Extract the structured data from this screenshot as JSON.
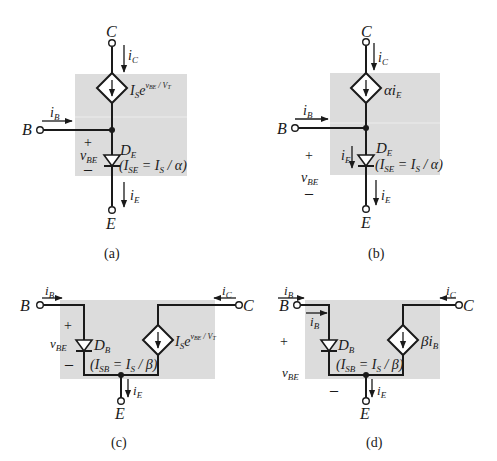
{
  "figure": {
    "panels": [
      {
        "id": "a",
        "caption": "(a)",
        "terminals": {
          "collector": "C",
          "base": "B",
          "emitter": "E"
        },
        "currents": {
          "ic": "i",
          "ic_sub": "C",
          "ib": "i",
          "ib_sub": "B",
          "ie": "i",
          "ie_sub": "E"
        },
        "source_label": {
          "main": "I",
          "sub": "S",
          "e": "e",
          "exp": "v",
          "exp_sub": "BE",
          "exp_tail": " / V",
          "exp_tail_sub": "T"
        },
        "diode": {
          "name": "D",
          "sub": "E",
          "param": "(I",
          "param_sub": "SE",
          "param_rest": " = I",
          "param_rest_sub": "S",
          "param_end": " / α)"
        },
        "vbe": {
          "plus": "+",
          "v": "v",
          "v_sub": "BE",
          "minus": "–"
        }
      },
      {
        "id": "b",
        "caption": "(b)",
        "terminals": {
          "collector": "C",
          "base": "B",
          "emitter": "E"
        },
        "currents": {
          "ic": "i",
          "ic_sub": "C",
          "ib": "i",
          "ib_sub": "B",
          "ie": "i",
          "ie_sub": "E"
        },
        "source_label": {
          "main": "αi",
          "sub": "E"
        },
        "diode": {
          "name": "D",
          "sub": "E",
          "param": "(I",
          "param_sub": "SE",
          "param_rest": " = I",
          "param_rest_sub": "S",
          "param_end": " / α)"
        },
        "vbe": {
          "plus": "+",
          "v": "v",
          "v_sub": "BE",
          "minus": "–"
        }
      },
      {
        "id": "c",
        "caption": "(c)",
        "terminals": {
          "collector": "C",
          "base": "B",
          "emitter": "E"
        },
        "currents": {
          "ic": "i",
          "ic_sub": "C",
          "ib": "i",
          "ib_sub": "B",
          "ie": "i",
          "ie_sub": "E"
        },
        "source_label": {
          "main": "I",
          "sub": "S",
          "e": "e",
          "exp": "v",
          "exp_sub": "BE",
          "exp_tail": " / V",
          "exp_tail_sub": "T"
        },
        "diode": {
          "name": "D",
          "sub": "B",
          "param": "(I",
          "param_sub": "SB",
          "param_rest": " = I",
          "param_rest_sub": "S",
          "param_end": " / β)"
        },
        "vbe": {
          "plus": "+",
          "v": "v",
          "v_sub": "BE",
          "minus": "–"
        }
      },
      {
        "id": "d",
        "caption": "(d)",
        "terminals": {
          "collector": "C",
          "base": "B",
          "emitter": "E"
        },
        "currents": {
          "ic": "i",
          "ic_sub": "C",
          "ib": "i",
          "ib_sub": "B",
          "ie": "i",
          "ie_sub": "E"
        },
        "source_label": {
          "main": "βi",
          "sub": "B"
        },
        "diode": {
          "name": "D",
          "sub": "B",
          "param": "(I",
          "param_sub": "SB",
          "param_rest": " = I",
          "param_rest_sub": "S",
          "param_end": " / β)"
        },
        "vbe": {
          "plus": "+",
          "v": "v",
          "v_sub": "BE",
          "minus": "–"
        }
      }
    ],
    "colors": {
      "shade": "#dcdcdc",
      "wire": "#1a1a1a",
      "background": "#ffffff"
    }
  }
}
